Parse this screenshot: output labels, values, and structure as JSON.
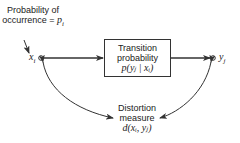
{
  "diagram": {
    "probability_label": {
      "line1": "Probability of",
      "line2": "occurrence = ",
      "symbol": "p",
      "subscript": "i"
    },
    "input_node": {
      "symbol": "x",
      "subscript": "i"
    },
    "output_node": {
      "symbol": "y",
      "subscript": "j"
    },
    "transition_box": {
      "line1": "Transition",
      "line2": "probability",
      "formula": "p(yⱼ | xᵢ)"
    },
    "distortion": {
      "line1": "Distortion",
      "line2": "measure",
      "formula": "d(xᵢ, yⱼ)"
    },
    "colors": {
      "stroke": "#333333",
      "text": "#222222",
      "background": "#ffffff"
    }
  }
}
